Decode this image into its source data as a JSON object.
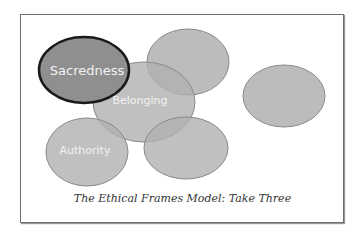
{
  "diagram": {
    "caption": "The Ethical Frames Model: Take Three",
    "colors": {
      "ellipse_fill": "#b0b0b0",
      "ellipse_stroke": "#8a8a8a",
      "highlight_fill": "#8f8f8f",
      "highlight_stroke": "#1a1a1a",
      "label_color": "#f2f2f2",
      "frame_border": "#6e6e6e"
    },
    "ellipses": [
      {
        "id": "top-middle",
        "label": ""
      },
      {
        "id": "right",
        "label": ""
      },
      {
        "id": "belonging",
        "label": "Belonging"
      },
      {
        "id": "authority",
        "label": "Authority"
      },
      {
        "id": "bottom-middle",
        "label": ""
      },
      {
        "id": "sacredness",
        "label": "Sacredness",
        "highlighted": true
      }
    ]
  }
}
